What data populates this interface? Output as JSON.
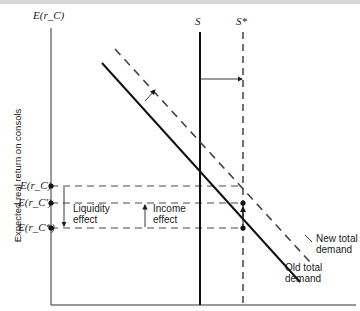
{
  "diagram": {
    "y_axis_title": "E(r_C)",
    "y_axis_label": "Expected real return on consols",
    "supply_label": "S",
    "new_supply_label": "S*",
    "rate_labels": {
      "initial": "E(r_C)",
      "intermediate": "E(r_C')",
      "final": "E(r_C*)"
    },
    "effects": {
      "liquidity": [
        "Liquidity",
        "effect"
      ],
      "income": [
        "Income",
        "effect"
      ]
    },
    "curves": {
      "new_demand": [
        "New total",
        "demand"
      ],
      "old_demand": [
        "Old total",
        "demand"
      ]
    }
  }
}
